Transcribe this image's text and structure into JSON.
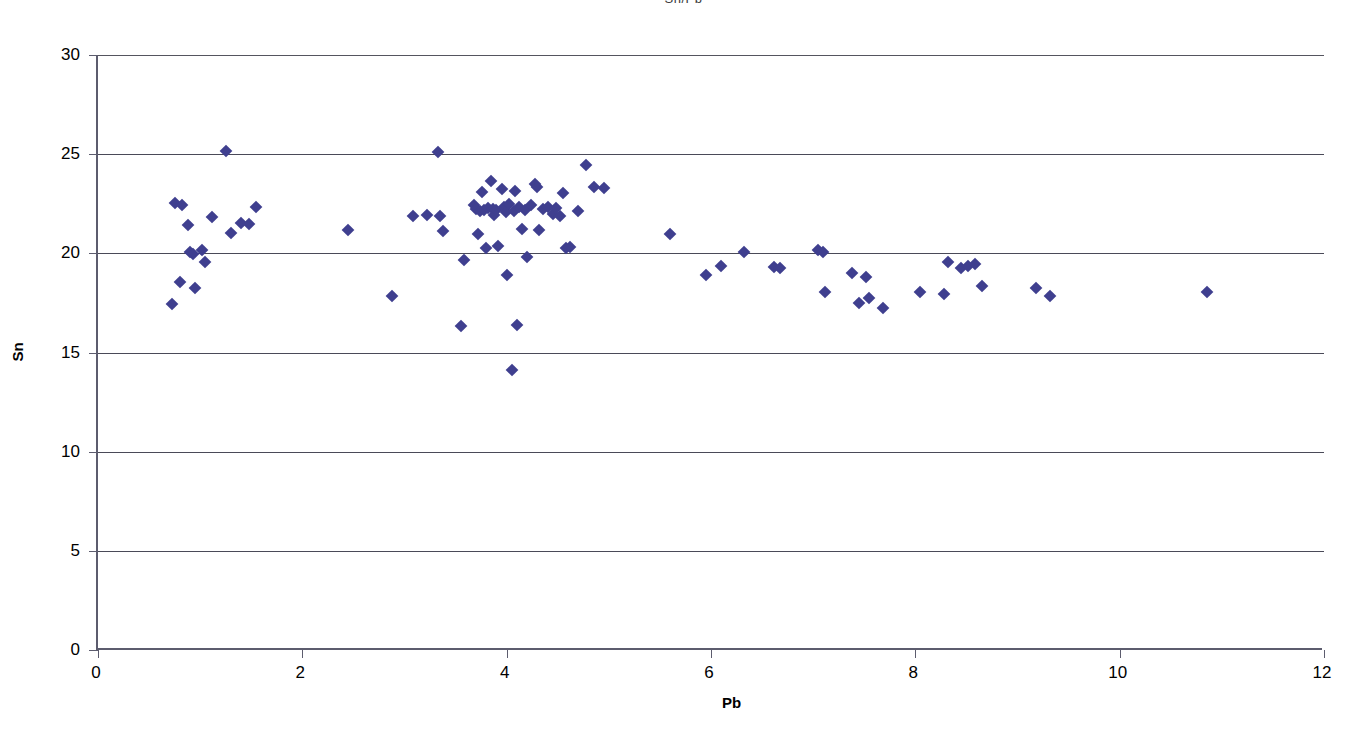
{
  "chart_data": {
    "type": "scatter",
    "title": "Sn/Pb",
    "xlabel": "Pb",
    "ylabel": "Sn",
    "xlim": [
      0,
      12
    ],
    "ylim": [
      0,
      30
    ],
    "xticks": [
      0,
      2,
      4,
      6,
      8,
      10,
      12
    ],
    "yticks": [
      0,
      5,
      10,
      15,
      20,
      25,
      30
    ],
    "grid": "horizontal",
    "legend": "none",
    "marker": "diamond",
    "marker_color": "#3f3f8f",
    "series": [
      {
        "name": "Sn vs Pb",
        "points": [
          [
            0.72,
            17.45
          ],
          [
            0.75,
            22.55
          ],
          [
            0.82,
            22.45
          ],
          [
            0.8,
            18.55
          ],
          [
            0.88,
            21.45
          ],
          [
            0.9,
            20.05
          ],
          [
            0.93,
            19.95
          ],
          [
            0.95,
            18.25
          ],
          [
            1.02,
            20.15
          ],
          [
            1.05,
            19.55
          ],
          [
            1.12,
            21.85
          ],
          [
            1.25,
            25.15
          ],
          [
            1.3,
            21.05
          ],
          [
            1.4,
            21.55
          ],
          [
            1.48,
            21.5
          ],
          [
            1.55,
            22.35
          ],
          [
            2.45,
            21.2
          ],
          [
            2.88,
            17.85
          ],
          [
            3.08,
            21.9
          ],
          [
            3.22,
            21.95
          ],
          [
            3.33,
            25.1
          ],
          [
            3.35,
            21.9
          ],
          [
            3.38,
            21.15
          ],
          [
            3.55,
            16.35
          ],
          [
            3.58,
            19.65
          ],
          [
            3.68,
            22.45
          ],
          [
            3.7,
            22.25
          ],
          [
            3.72,
            20.95
          ],
          [
            3.74,
            22.15
          ],
          [
            3.76,
            23.1
          ],
          [
            3.78,
            22.2
          ],
          [
            3.8,
            20.25
          ],
          [
            3.82,
            22.3
          ],
          [
            3.85,
            23.65
          ],
          [
            3.87,
            22.25
          ],
          [
            3.88,
            21.95
          ],
          [
            3.9,
            22.2
          ],
          [
            3.92,
            20.35
          ],
          [
            3.95,
            23.25
          ],
          [
            3.97,
            22.35
          ],
          [
            3.99,
            22.1
          ],
          [
            4.0,
            18.9
          ],
          [
            4.02,
            22.5
          ],
          [
            4.05,
            14.1
          ],
          [
            4.07,
            22.15
          ],
          [
            4.08,
            23.15
          ],
          [
            4.1,
            16.4
          ],
          [
            4.12,
            22.35
          ],
          [
            4.15,
            21.25
          ],
          [
            4.18,
            22.2
          ],
          [
            4.2,
            19.8
          ],
          [
            4.24,
            22.45
          ],
          [
            4.28,
            23.5
          ],
          [
            4.3,
            23.35
          ],
          [
            4.32,
            21.2
          ],
          [
            4.36,
            22.25
          ],
          [
            4.4,
            22.35
          ],
          [
            4.45,
            22.0
          ],
          [
            4.48,
            22.3
          ],
          [
            4.52,
            21.9
          ],
          [
            4.55,
            23.05
          ],
          [
            4.58,
            20.25
          ],
          [
            4.62,
            20.3
          ],
          [
            4.7,
            22.15
          ],
          [
            4.78,
            24.45
          ],
          [
            4.85,
            23.35
          ],
          [
            4.95,
            23.3
          ],
          [
            5.6,
            20.95
          ],
          [
            5.95,
            18.9
          ],
          [
            6.1,
            19.35
          ],
          [
            6.32,
            20.05
          ],
          [
            6.62,
            19.3
          ],
          [
            6.68,
            19.25
          ],
          [
            7.05,
            20.15
          ],
          [
            7.1,
            20.05
          ],
          [
            7.12,
            18.05
          ],
          [
            7.38,
            19.0
          ],
          [
            7.45,
            17.5
          ],
          [
            7.52,
            18.8
          ],
          [
            7.55,
            17.75
          ],
          [
            7.68,
            17.25
          ],
          [
            8.05,
            18.05
          ],
          [
            8.28,
            17.95
          ],
          [
            8.32,
            19.55
          ],
          [
            8.45,
            19.25
          ],
          [
            8.52,
            19.35
          ],
          [
            8.58,
            19.45
          ],
          [
            8.65,
            18.35
          ],
          [
            9.18,
            18.25
          ],
          [
            9.32,
            17.85
          ],
          [
            10.85,
            18.05
          ]
        ]
      }
    ]
  },
  "axis": {
    "y_title": "Sn",
    "x_title": "Pb",
    "y_tick_labels": [
      "30",
      "25",
      "20",
      "15",
      "10",
      "5",
      "0"
    ],
    "x_tick_labels": [
      "0",
      "2",
      "4",
      "6",
      "8",
      "10",
      "12"
    ]
  },
  "colors": {
    "marker": "#3f3f8f",
    "gridline": "#4a4a58",
    "axis": "#5c5c6e",
    "background": "#ffffff"
  }
}
